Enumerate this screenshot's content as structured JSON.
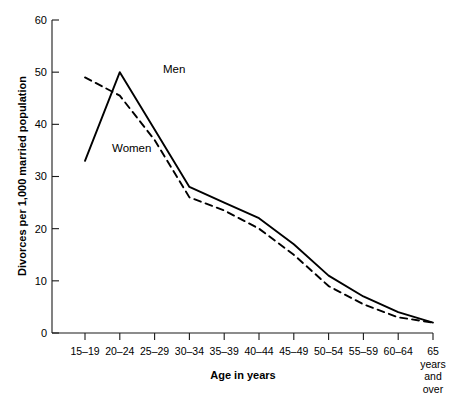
{
  "chart_data": {
    "type": "line",
    "title": "",
    "xlabel": "Age in years",
    "ylabel": "Divorces per 1,000 married population",
    "categories": [
      "15–19",
      "20–24",
      "25–29",
      "30–34",
      "35–39",
      "40–44",
      "45–49",
      "50–54",
      "55–59",
      "60–64",
      "65 years and over"
    ],
    "xtick_labels": [
      "15–19",
      "20–24",
      "25–29",
      "30–34",
      "35–39",
      "40–44",
      "45–49",
      "50–54",
      "55–59",
      "60–64",
      "65"
    ],
    "last_tick_extra_lines": [
      "years",
      "and",
      "over"
    ],
    "ytick_labels": [
      "0",
      "10",
      "20",
      "30",
      "40",
      "50",
      "60"
    ],
    "yticks": [
      0,
      10,
      20,
      30,
      40,
      50,
      60
    ],
    "ylim": [
      0,
      60
    ],
    "grid": false,
    "legend_position": "inline-annotation",
    "series": [
      {
        "name": "Men",
        "style": "solid",
        "color": "#000000",
        "values": [
          33,
          50,
          39,
          28,
          25,
          22,
          17,
          11,
          7,
          4,
          2
        ]
      },
      {
        "name": "Women",
        "style": "dashed",
        "color": "#000000",
        "values": [
          49,
          45.5,
          37,
          26,
          23.5,
          20,
          15,
          9,
          5.5,
          3,
          2
        ]
      }
    ],
    "annotations": [
      {
        "text": "Men",
        "x_px": 163,
        "y_px": 73
      },
      {
        "text": "Women",
        "x_px": 112,
        "y_px": 152
      }
    ]
  }
}
